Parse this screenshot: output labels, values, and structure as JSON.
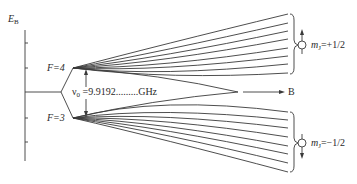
{
  "diagram": {
    "axis_label": "E",
    "axis_label_sub": "B",
    "levels": [
      {
        "label": "F=4",
        "y": 68
      },
      {
        "label": "F=3",
        "y": 118
      }
    ],
    "splitting_label_symbol": "ν",
    "splitting_label_sub": "0",
    "splitting_label_value": " =9.9192.........GHz",
    "field_arrow_label": "B",
    "upper_group": {
      "label_symbol": "m",
      "label_sub": "J",
      "label_value": "=+1/2",
      "spin_direction": "up",
      "line_count": 8
    },
    "lower_group": {
      "label_symbol": "m",
      "label_sub": "J",
      "label_value": "=−1/2",
      "spin_direction": "down",
      "line_count": 8
    },
    "colors": {
      "line": "#3a3a3a",
      "text": "#2a2a2a"
    }
  }
}
